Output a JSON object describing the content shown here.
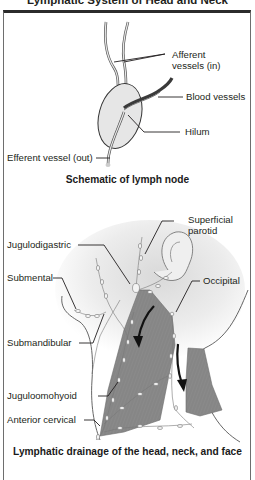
{
  "title": "Lymphatic System of Head and Neck",
  "panels": {
    "node": {
      "caption": "Schematic of lymph node",
      "labels": {
        "afferent_line1": "Afferent",
        "afferent_line2": "vessels (in)",
        "blood_vessels": "Blood vessels",
        "hilum": "Hilum",
        "efferent": "Efferent vessel (out)"
      }
    },
    "neck": {
      "caption": "Lymphatic drainage of the head, neck, and face",
      "labels": {
        "superficial_parotid_line1": "Superficial",
        "superficial_parotid_line2": "parotid",
        "jugulodigastric": "Jugulodigastric",
        "submental": "Submental",
        "occipital": "Occipital",
        "submandibular": "Submandibular",
        "juguloomohyoid": "Juguloomohyoid",
        "anterior_cervical": "Anterior cervical"
      }
    }
  },
  "colors": {
    "frame_top": "#2b2b2b",
    "node_fill": "#e6e6e6",
    "muscle_fill": "#8c8c8c",
    "skin_shade": "#e9e9e9",
    "leader_line": "#231f20"
  }
}
